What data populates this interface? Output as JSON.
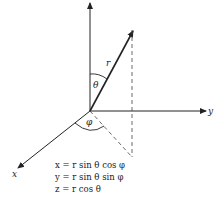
{
  "diagram": {
    "axes": {
      "x_label": "x",
      "y_label": "y",
      "z_label": ""
    },
    "vector_label": "r",
    "polar_angle_label": "θ",
    "azimuth_angle_label": "φ",
    "equations": [
      "x = r sin θ cos φ",
      "y = r sin θ sin φ",
      "z = r cos θ"
    ],
    "colors": {
      "line": "#222222",
      "background": "#ffffff"
    }
  }
}
